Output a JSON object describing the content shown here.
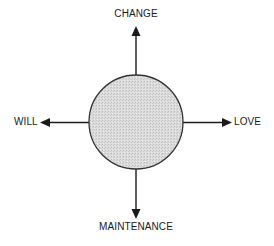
{
  "diagram": {
    "type": "radial-axis",
    "center": {
      "shape": "circle",
      "fill": "#d9d9d9",
      "stroke": "#333333"
    },
    "arrows": [
      {
        "direction": "up",
        "label": "CHANGE"
      },
      {
        "direction": "left",
        "label": "WILL"
      },
      {
        "direction": "right",
        "label": "LOVE"
      },
      {
        "direction": "down",
        "label": "MAINTENANCE"
      }
    ],
    "colors": {
      "line": "#1a1a1a",
      "text": "#1a1a1a",
      "background": "#ffffff"
    }
  }
}
